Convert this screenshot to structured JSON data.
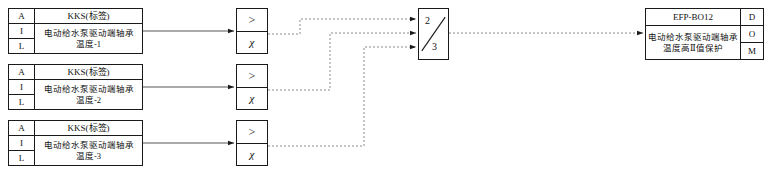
{
  "diagram": {
    "line_color": "#444444",
    "border_color": "#1a1a1a",
    "background": "#ffffff"
  },
  "inputs": [
    {
      "code_label": "A",
      "type_label": "I",
      "level_label": "L",
      "kks": "KKS(标签)",
      "desc_line1": "电动给水泵驱动端轴承",
      "desc_line2": "温度-1"
    },
    {
      "code_label": "A",
      "type_label": "I",
      "level_label": "L",
      "kks": "KKS(标签)",
      "desc_line1": "电动给水泵驱动端轴承",
      "desc_line2": "温度-2"
    },
    {
      "code_label": "A",
      "type_label": "I",
      "level_label": "L",
      "kks": "KKS(标签)",
      "desc_line1": "电动给水泵驱动端轴承",
      "desc_line2": "温度-3"
    }
  ],
  "comparators": [
    {
      "operator": ">",
      "variable": "χ"
    },
    {
      "operator": ">",
      "variable": "χ"
    },
    {
      "operator": ">",
      "variable": "χ"
    }
  ],
  "voter": {
    "numerator": "2",
    "denominator": "3"
  },
  "output": {
    "tag": "EFP-BO12",
    "desc_line1": "电动给水泵驱动端轴承",
    "desc_line2": "温度高Ⅱ值保护",
    "d_label": "D",
    "o_label": "O",
    "m_label": "M"
  }
}
